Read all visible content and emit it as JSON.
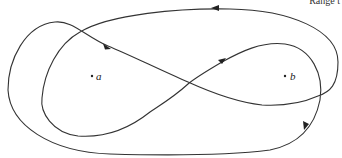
{
  "header": {
    "text": "Range t"
  },
  "diagram": {
    "points": [
      {
        "label": "a",
        "x": 92,
        "y": 77
      },
      {
        "label": "b",
        "x": 285,
        "y": 76
      }
    ],
    "curve_color": "#333333",
    "arrow_count": 4
  }
}
